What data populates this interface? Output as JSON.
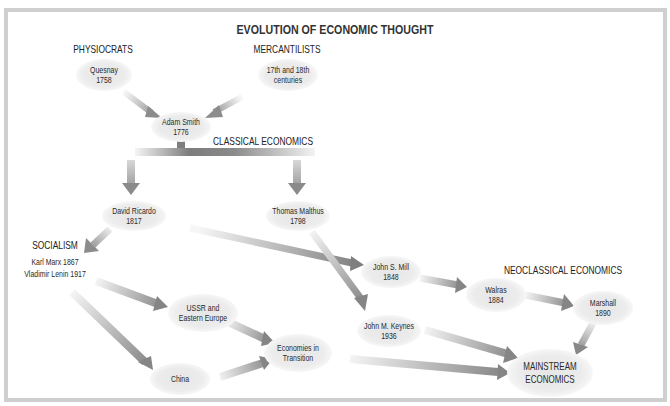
{
  "title": "EVOLUTION OF ECONOMIC THOUGHT",
  "colors": {
    "frame": "#cfcfcf",
    "node_fill": "#ebebeb",
    "arrow_dark": "#8c8c8c",
    "arrow_light": "#f2f2f2",
    "text": "#2a2a2a"
  },
  "sections": {
    "physiocrats": "PHYSIOCRATS",
    "mercantilists": "MERCANTILISTS",
    "classical": "CLASSICAL ECONOMICS",
    "socialism": "SOCIALISM",
    "neoclassical": "NEOCLASSICAL ECONOMICS"
  },
  "nodes": {
    "quesnay": {
      "line1": "Quesnay",
      "line2": "1758"
    },
    "mercantilists": {
      "line1": "17th and 18th",
      "line2": "centuries"
    },
    "smith": {
      "line1": "Adam Smith",
      "line2": "1776"
    },
    "ricardo": {
      "line1": "David Ricardo",
      "line2": "1817"
    },
    "malthus": {
      "line1": "Thomas Malthus",
      "line2": "1798"
    },
    "socialism": {
      "line1": "Karl Marx 1867",
      "line2": "Vladimir Lenin 1917"
    },
    "mill": {
      "line1": "John S. Mill",
      "line2": "1848"
    },
    "walras": {
      "line1": "Walras",
      "line2": "1884"
    },
    "marshall": {
      "line1": "Marshall",
      "line2": "1890"
    },
    "keynes": {
      "line1": "John M. Keynes",
      "line2": "1936"
    },
    "ussr": {
      "line1": "USSR and",
      "line2": "Eastern Europe"
    },
    "transition": {
      "line1": "Economies in",
      "line2": "Transition"
    },
    "china": {
      "line1": "China"
    },
    "mainstream": {
      "line1": "MAINSTREAM",
      "line2": "ECONOMICS"
    }
  },
  "edges": [
    [
      "Quesnay",
      "Adam Smith"
    ],
    [
      "17th and 18th centuries",
      "Adam Smith"
    ],
    [
      "Adam Smith",
      "Classical Economics"
    ],
    [
      "Classical Economics",
      "David Ricardo"
    ],
    [
      "Classical Economics",
      "Thomas Malthus"
    ],
    [
      "David Ricardo",
      "Socialism"
    ],
    [
      "David Ricardo",
      "John S. Mill"
    ],
    [
      "Thomas Malthus",
      "John M. Keynes"
    ],
    [
      "John S. Mill",
      "Walras"
    ],
    [
      "Walras",
      "Marshall"
    ],
    [
      "Marshall",
      "Mainstream Economics"
    ],
    [
      "John M. Keynes",
      "Mainstream Economics"
    ],
    [
      "Socialism",
      "USSR and Eastern Europe"
    ],
    [
      "Socialism",
      "China"
    ],
    [
      "USSR and Eastern Europe",
      "Economies in Transition"
    ],
    [
      "China",
      "Economies in Transition"
    ],
    [
      "Economies in Transition",
      "Mainstream Economics"
    ]
  ]
}
